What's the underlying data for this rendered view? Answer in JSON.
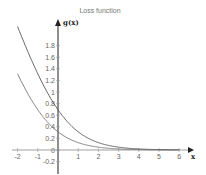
{
  "chart_data": {
    "type": "line",
    "title": "Loss function",
    "xlabel": "x",
    "ylabel": "g(x)",
    "xlim": [
      -2,
      6.3
    ],
    "ylim": [
      -0.25,
      2.2
    ],
    "x_ticks": [
      "-2",
      "-1",
      "0",
      "1",
      "2",
      "3",
      "4",
      "5",
      "6"
    ],
    "y_ticks": [
      "-0.2",
      "0",
      "0.2",
      "0.4",
      "0.6",
      "0.8",
      "1",
      "1.2",
      "1.4",
      "1.6",
      "1.8"
    ],
    "grid": false,
    "legend": null,
    "series": [
      {
        "name": "upper curve",
        "color": "#555555",
        "x": [
          -2,
          -1.5,
          -1,
          -0.5,
          0,
          0.5,
          1,
          1.5,
          2,
          3,
          4,
          5,
          6
        ],
        "values": [
          2.13,
          1.7,
          1.31,
          0.97,
          0.69,
          0.47,
          0.31,
          0.2,
          0.13,
          0.05,
          0.02,
          0.01,
          0.0
        ]
      },
      {
        "name": "lower curve",
        "color": "#777777",
        "x": [
          -2,
          -1.5,
          -1,
          -0.5,
          0,
          0.5,
          1,
          1.5,
          2,
          3,
          4,
          5,
          6
        ],
        "values": [
          1.31,
          0.97,
          0.69,
          0.47,
          0.31,
          0.2,
          0.13,
          0.08,
          0.05,
          0.02,
          0.01,
          0.0,
          0.0
        ]
      }
    ]
  }
}
